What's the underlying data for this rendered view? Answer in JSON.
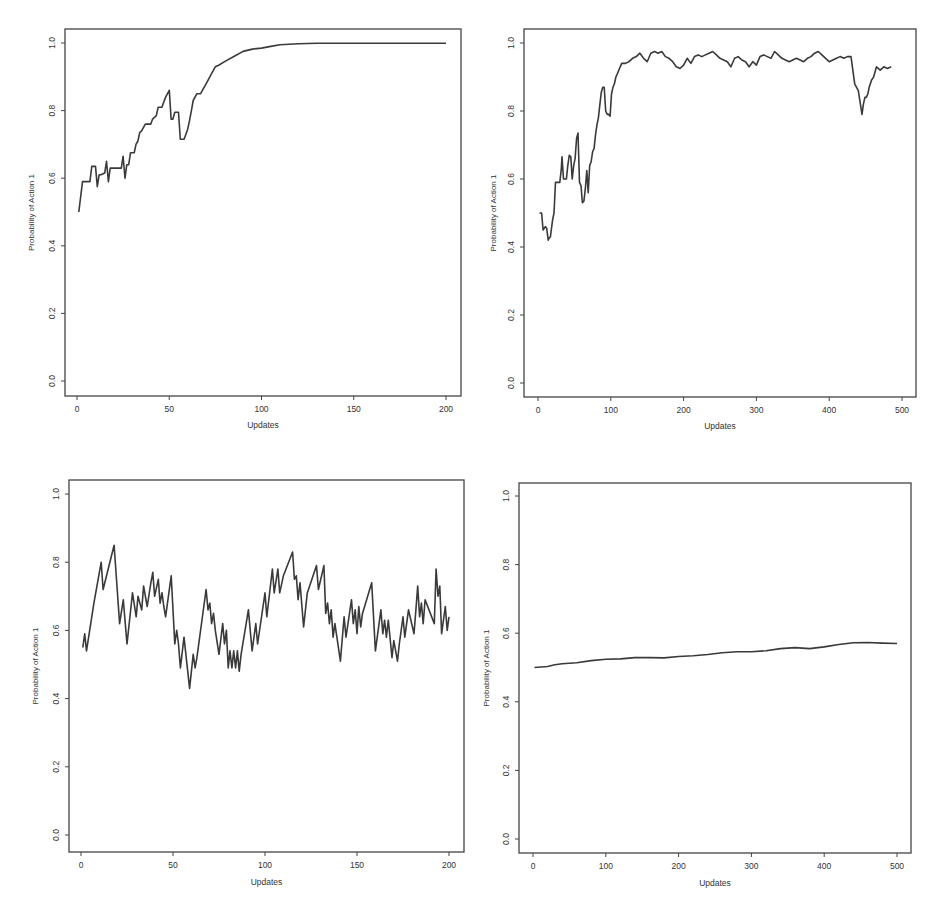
{
  "colors": {
    "line": "#3a3a3a",
    "frame": "#444444",
    "text": "#333333",
    "background": "#ffffff"
  },
  "chart_data": [
    {
      "id": "top-left",
      "type": "line",
      "title": "",
      "xlabel": "Updates",
      "ylabel": "Probability of Action 1",
      "xlim": [
        0,
        200
      ],
      "ylim": [
        0.0,
        1.0
      ],
      "xticks": [
        0,
        50,
        100,
        150,
        200
      ],
      "xtick_labels": [
        "0",
        "50",
        "100",
        "150",
        "200"
      ],
      "yticks": [
        0.0,
        0.2,
        0.4,
        0.6,
        0.8,
        1.0
      ],
      "ytick_labels": [
        "0.0",
        "0.2",
        "0.4",
        "0.6",
        "0.8",
        "1.0"
      ],
      "grid": false,
      "legend": null,
      "layout": {
        "frame": [
          65,
          29,
          461,
          396
        ],
        "x0px": 77,
        "x1px": 446,
        "y0px": 381,
        "y1px": 43,
        "xlabel_y": 428,
        "ylabel_x": 34
      },
      "x": [
        1,
        3,
        4,
        7,
        8,
        10,
        11,
        12,
        13,
        15,
        16,
        17,
        18,
        19,
        20,
        24,
        25,
        26,
        27,
        28,
        29,
        31,
        32,
        33,
        34,
        35,
        37,
        38,
        40,
        41,
        43,
        44,
        46,
        48,
        50,
        51,
        52,
        53,
        54,
        55,
        56,
        57,
        58,
        59,
        60,
        61,
        62,
        63,
        65,
        67,
        70,
        73,
        75,
        77,
        80,
        85,
        90,
        95,
        100,
        105,
        110,
        120,
        130,
        150,
        170,
        200
      ],
      "values": [
        0.5,
        0.59,
        0.59,
        0.59,
        0.635,
        0.635,
        0.575,
        0.61,
        0.61,
        0.615,
        0.65,
        0.59,
        0.63,
        0.63,
        0.63,
        0.63,
        0.665,
        0.6,
        0.64,
        0.64,
        0.675,
        0.675,
        0.7,
        0.71,
        0.735,
        0.74,
        0.76,
        0.76,
        0.76,
        0.775,
        0.785,
        0.81,
        0.81,
        0.84,
        0.86,
        0.775,
        0.775,
        0.795,
        0.795,
        0.795,
        0.715,
        0.715,
        0.715,
        0.73,
        0.745,
        0.77,
        0.8,
        0.83,
        0.85,
        0.85,
        0.88,
        0.91,
        0.93,
        0.935,
        0.945,
        0.96,
        0.975,
        0.982,
        0.985,
        0.99,
        0.995,
        0.998,
        0.999,
        0.999,
        0.999,
        0.999
      ]
    },
    {
      "id": "top-right",
      "type": "line",
      "title": "",
      "xlabel": "Updates",
      "ylabel": "Probability of Action 1",
      "xlim": [
        0,
        500
      ],
      "ylim": [
        0.0,
        1.0
      ],
      "xticks": [
        0,
        100,
        200,
        300,
        400,
        500
      ],
      "xtick_labels": [
        "0",
        "100",
        "200",
        "300",
        "400",
        "500"
      ],
      "yticks": [
        0.0,
        0.2,
        0.4,
        0.6,
        0.8,
        1.0
      ],
      "ytick_labels": [
        "0.0",
        "0.2",
        "0.4",
        "0.6",
        "0.8",
        "1.0"
      ],
      "grid": false,
      "legend": null,
      "layout": {
        "frame": [
          524,
          29,
          916,
          397
        ],
        "x0px": 538,
        "x1px": 902,
        "y0px": 383,
        "y1px": 43,
        "xlabel_y": 429,
        "ylabel_x": 496
      },
      "x": [
        2,
        5,
        7,
        10,
        12,
        14,
        15,
        17,
        20,
        22,
        24,
        26,
        28,
        30,
        32,
        33,
        35,
        37,
        39,
        41,
        43,
        45,
        47,
        49,
        51,
        53,
        55,
        57,
        59,
        61,
        63,
        65,
        67,
        69,
        71,
        73,
        75,
        77,
        79,
        81,
        83,
        85,
        87,
        89,
        91,
        93,
        95,
        97,
        99,
        101,
        103,
        105,
        107,
        109,
        112,
        115,
        120,
        125,
        130,
        135,
        140,
        145,
        150,
        155,
        160,
        165,
        170,
        175,
        180,
        185,
        190,
        195,
        200,
        205,
        210,
        215,
        220,
        225,
        230,
        235,
        240,
        245,
        250,
        255,
        260,
        265,
        270,
        275,
        280,
        285,
        290,
        295,
        300,
        305,
        310,
        315,
        320,
        325,
        330,
        335,
        340,
        345,
        350,
        355,
        360,
        365,
        370,
        375,
        380,
        385,
        390,
        395,
        400,
        405,
        410,
        415,
        420,
        425,
        430,
        435,
        440,
        445,
        447,
        449,
        451,
        453,
        455,
        458,
        461,
        465,
        470,
        475,
        480,
        485,
        490,
        495,
        500
      ],
      "values": [
        0.5,
        0.5,
        0.45,
        0.46,
        0.455,
        0.42,
        0.425,
        0.43,
        0.48,
        0.5,
        0.59,
        0.59,
        0.59,
        0.59,
        0.63,
        0.665,
        0.6,
        0.6,
        0.6,
        0.64,
        0.67,
        0.665,
        0.6,
        0.64,
        0.66,
        0.72,
        0.735,
        0.59,
        0.58,
        0.53,
        0.535,
        0.57,
        0.625,
        0.56,
        0.64,
        0.65,
        0.68,
        0.69,
        0.73,
        0.76,
        0.78,
        0.82,
        0.855,
        0.87,
        0.87,
        0.8,
        0.79,
        0.79,
        0.785,
        0.85,
        0.87,
        0.88,
        0.9,
        0.91,
        0.925,
        0.94,
        0.94,
        0.945,
        0.955,
        0.96,
        0.97,
        0.955,
        0.945,
        0.97,
        0.975,
        0.97,
        0.975,
        0.96,
        0.955,
        0.945,
        0.93,
        0.925,
        0.935,
        0.955,
        0.94,
        0.96,
        0.965,
        0.96,
        0.965,
        0.97,
        0.975,
        0.965,
        0.955,
        0.95,
        0.945,
        0.93,
        0.955,
        0.96,
        0.95,
        0.945,
        0.93,
        0.945,
        0.935,
        0.96,
        0.965,
        0.96,
        0.955,
        0.975,
        0.965,
        0.955,
        0.95,
        0.945,
        0.95,
        0.955,
        0.95,
        0.945,
        0.955,
        0.96,
        0.97,
        0.975,
        0.965,
        0.955,
        0.945,
        0.95,
        0.955,
        0.96,
        0.955,
        0.96,
        0.96,
        0.88,
        0.86,
        0.79,
        0.82,
        0.84,
        0.84,
        0.85,
        0.87,
        0.89,
        0.9,
        0.93,
        0.92,
        0.93,
        0.925,
        0.93
      ]
    },
    {
      "id": "bottom-left",
      "type": "line",
      "title": "",
      "xlabel": "Updates",
      "ylabel": "Probability of Action 1",
      "xlim": [
        0,
        200
      ],
      "ylim": [
        0.0,
        1.0
      ],
      "xticks": [
        0,
        50,
        100,
        150,
        200
      ],
      "xtick_labels": [
        "0",
        "50",
        "100",
        "150",
        "200"
      ],
      "yticks": [
        0.0,
        0.2,
        0.4,
        0.6,
        0.8,
        1.0
      ],
      "ytick_labels": [
        "0.0",
        "0.2",
        "0.4",
        "0.6",
        "0.8",
        "1.0"
      ],
      "grid": false,
      "legend": null,
      "layout": {
        "frame": [
          69,
          480,
          464,
          852
        ],
        "x0px": 81,
        "x1px": 449,
        "y0px": 835,
        "y1px": 494,
        "xlabel_y": 885,
        "ylabel_x": 38
      },
      "x": [
        1,
        2,
        3,
        7,
        11,
        12,
        18,
        21,
        23,
        25,
        28,
        30,
        31,
        33,
        34,
        36,
        38,
        39,
        40,
        42,
        43,
        44,
        45,
        46,
        49,
        51,
        52,
        53,
        54,
        56,
        59,
        61,
        62,
        63,
        68,
        69,
        70,
        71,
        72,
        73,
        75,
        77,
        78,
        79,
        80,
        81,
        82,
        83,
        84,
        85,
        86,
        87,
        91,
        93,
        95,
        96,
        100,
        101,
        104,
        105,
        107,
        108,
        110,
        115,
        116,
        117,
        118,
        119,
        121,
        123,
        128,
        129,
        132,
        133,
        134,
        135,
        136,
        137,
        138,
        141,
        143,
        144,
        147,
        148,
        149,
        150,
        151,
        152,
        153,
        158,
        160,
        163,
        164,
        165,
        166,
        167,
        169,
        170,
        172,
        173,
        175,
        176,
        178,
        181,
        182,
        183,
        184,
        185,
        186,
        187,
        192,
        193,
        194,
        195,
        196,
        198,
        199,
        200
      ],
      "values": [
        0.55,
        0.59,
        0.54,
        0.68,
        0.8,
        0.72,
        0.85,
        0.62,
        0.69,
        0.56,
        0.71,
        0.64,
        0.7,
        0.66,
        0.73,
        0.67,
        0.74,
        0.77,
        0.7,
        0.75,
        0.68,
        0.71,
        0.67,
        0.64,
        0.76,
        0.56,
        0.6,
        0.56,
        0.49,
        0.58,
        0.43,
        0.53,
        0.49,
        0.52,
        0.72,
        0.66,
        0.68,
        0.62,
        0.65,
        0.6,
        0.53,
        0.62,
        0.56,
        0.6,
        0.49,
        0.54,
        0.49,
        0.54,
        0.49,
        0.54,
        0.48,
        0.53,
        0.66,
        0.54,
        0.62,
        0.56,
        0.71,
        0.64,
        0.78,
        0.71,
        0.78,
        0.71,
        0.76,
        0.83,
        0.75,
        0.76,
        0.69,
        0.74,
        0.61,
        0.71,
        0.79,
        0.72,
        0.79,
        0.65,
        0.68,
        0.62,
        0.66,
        0.58,
        0.62,
        0.51,
        0.64,
        0.58,
        0.69,
        0.62,
        0.66,
        0.59,
        0.67,
        0.61,
        0.65,
        0.74,
        0.54,
        0.66,
        0.59,
        0.63,
        0.58,
        0.63,
        0.52,
        0.57,
        0.51,
        0.56,
        0.64,
        0.58,
        0.66,
        0.59,
        0.66,
        0.73,
        0.64,
        0.68,
        0.62,
        0.69,
        0.62,
        0.78,
        0.7,
        0.73,
        0.59,
        0.67,
        0.6,
        0.64
      ]
    },
    {
      "id": "bottom-right",
      "type": "line",
      "title": "",
      "xlabel": "Updates",
      "ylabel": "Probability of Action 1",
      "xlim": [
        0,
        500
      ],
      "ylim": [
        0.0,
        1.0
      ],
      "xticks": [
        0,
        100,
        200,
        300,
        400,
        500
      ],
      "xtick_labels": [
        "0",
        "100",
        "200",
        "300",
        "400",
        "500"
      ],
      "yticks": [
        0.0,
        0.2,
        0.4,
        0.6,
        0.8,
        1.0
      ],
      "ytick_labels": [
        "0.0",
        "0.2",
        "0.4",
        "0.6",
        "0.8",
        "1.0"
      ],
      "grid": false,
      "legend": null,
      "layout": {
        "frame": [
          519,
          483,
          911,
          853
        ],
        "x0px": 533,
        "x1px": 897,
        "y0px": 839,
        "y1px": 496,
        "xlabel_y": 886,
        "ylabel_x": 489
      },
      "x": [
        2,
        20,
        30,
        40,
        60,
        80,
        100,
        120,
        140,
        160,
        180,
        200,
        220,
        240,
        260,
        280,
        300,
        320,
        340,
        360,
        380,
        400,
        420,
        440,
        460,
        480,
        500
      ],
      "values": [
        0.5,
        0.503,
        0.508,
        0.511,
        0.514,
        0.52,
        0.524,
        0.525,
        0.529,
        0.529,
        0.528,
        0.532,
        0.534,
        0.538,
        0.543,
        0.546,
        0.546,
        0.549,
        0.555,
        0.558,
        0.555,
        0.56,
        0.567,
        0.572,
        0.573,
        0.571,
        0.57
      ]
    }
  ]
}
